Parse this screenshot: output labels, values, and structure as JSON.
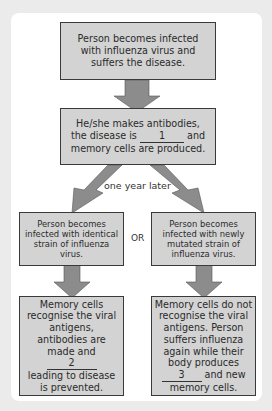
{
  "diagram": {
    "top_cut_text": "...g      g...",
    "boxes": {
      "infection": "Person becomes infected with influenza virus and suffers the disease.",
      "antibodies_pre": "He/she makes antibodies, the disease is",
      "antibodies_blank": "1",
      "antibodies_post": "and memory cells are produced.",
      "identical_strain": "Person becomes infected with identical strain of influenza virus.",
      "mutated_strain": "Person becomes infected with newly mutated strain of influenza virus.",
      "recognise_pre": "Memory cells recognise the viral antigens, antibodies are made and",
      "recognise_blank": "2",
      "recognise_post": "leading to disease is prevented.",
      "not_recognise_pre": "Memory cells do not recognise the viral antigens. Person suffers influenza again while their body produces",
      "not_recognise_blank": "3",
      "not_recognise_post": "and new memory cells."
    },
    "labels": {
      "time": "one year later",
      "or": "OR"
    },
    "colors": {
      "box_fill": "#d3d3d3",
      "arrow_fill": "#8c8c8c",
      "border": "#3a3a3a",
      "background": "#ebebeb",
      "panel": "#ffffff"
    }
  }
}
